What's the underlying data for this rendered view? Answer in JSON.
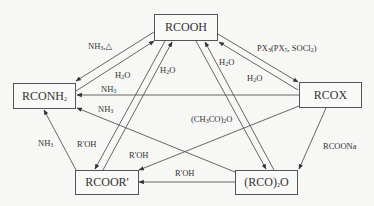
{
  "nodes": {
    "acid": {
      "label": "RCOOH"
    },
    "acyl_halide": {
      "label": "RCOX"
    },
    "amide": {
      "label": "RCONH",
      "sub": "2"
    },
    "ester": {
      "label": "RCOOR'"
    },
    "anhydride": {
      "label_pre": "(RCO)",
      "sub": "2",
      "label_post": "O"
    }
  },
  "edges": [
    {
      "from": "acid",
      "to": "amide",
      "reagent": "NH3, △"
    },
    {
      "from": "amide",
      "to": "acid",
      "reagent": "H2O"
    },
    {
      "from": "acid",
      "to": "acyl_halide",
      "reagent": "PX3(PX5, SOCl2)"
    },
    {
      "from": "acyl_halide",
      "to": "acid",
      "reagent": "H2O"
    },
    {
      "from": "ester",
      "to": "acid",
      "reagent": "H2O"
    },
    {
      "from": "acid",
      "to": "ester",
      "reagent": ""
    },
    {
      "from": "anhydride",
      "to": "acid",
      "reagent": "H2O"
    },
    {
      "from": "acid",
      "to": "anhydride",
      "reagent": ""
    },
    {
      "from": "acyl_halide",
      "to": "amide",
      "reagent": "NH3"
    },
    {
      "from": "anhydride",
      "to": "amide",
      "reagent": "NH3"
    },
    {
      "from": "ester",
      "to": "amide",
      "reagent": "NH3"
    },
    {
      "from": "acyl_halide",
      "to": "ester",
      "reagent": "R'OH"
    },
    {
      "from": "anhydride",
      "to": "ester",
      "reagent": "R'OH"
    },
    {
      "from": "acyl_halide",
      "to": "anhydride",
      "reagent": "RCOONa"
    },
    {
      "from": "acid",
      "to": "anhydride",
      "reagent": "(CH3CO)2O"
    }
  ],
  "labels": {
    "nh3_heat": {
      "pre": "NH",
      "sub": "3",
      "post": ",△"
    },
    "h2o": {
      "pre": "H",
      "sub": "2",
      "post": "O"
    },
    "px": {
      "a": "PX",
      "a_sub": "3",
      "b": "(PX",
      "b_sub": "5",
      "c": ", SOCl",
      "c_sub": "2",
      "d": ")"
    },
    "nh3": {
      "pre": "NH",
      "sub": "3"
    },
    "ac2o": {
      "a": "(CH",
      "a_sub": "3",
      "b": "CO)",
      "b_sub": "2",
      "c": "O"
    },
    "roh": "R'OH",
    "rcoona": "RCOONa"
  }
}
